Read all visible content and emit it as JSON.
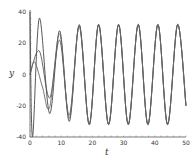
{
  "chart_data": {
    "type": "line",
    "title": "",
    "xlabel": "t",
    "ylabel": "y",
    "xlim": [
      0,
      50
    ],
    "ylim": [
      -40,
      40
    ],
    "xticks": [
      0,
      10,
      20,
      30,
      40,
      50
    ],
    "yticks": [
      -40,
      -20,
      0,
      20,
      40
    ],
    "grid": false,
    "legend": null,
    "series": [
      {
        "name": "curve-1",
        "description": "starts at 40, drops to about -40 near t=0.8, then converges to sinusoid",
        "x": [
          0,
          0.8,
          3,
          6.3,
          9.5,
          12.6,
          15.8,
          19,
          22,
          25.2,
          28.4,
          31.5,
          34.7,
          37.8,
          41,
          44.1,
          47.3,
          50
        ],
        "y": [
          40,
          -40,
          36,
          -25,
          28,
          -30,
          32,
          -32,
          32,
          -32,
          32,
          -32,
          32,
          -32,
          32,
          -32,
          32,
          -20
        ]
      },
      {
        "name": "curve-2",
        "description": "starts at 0, rises to about 15 near t=3, then to sinusoid",
        "x": [
          0,
          3,
          6.3,
          9.5,
          12.6,
          15.8,
          19,
          22,
          25.2,
          28.4,
          31.5,
          34.7,
          37.8,
          41,
          44.1,
          47.3,
          50
        ],
        "y": [
          0,
          15,
          -15,
          22,
          -26,
          31,
          -32,
          32,
          -32,
          32,
          -32,
          32,
          -32,
          32,
          -32,
          32,
          -20
        ]
      },
      {
        "name": "curve-3",
        "description": "starts at 0, rises to about 8, then sinusoid",
        "x": [
          0,
          1.5,
          4,
          6.3,
          9.5,
          12.6,
          15.8,
          19,
          22,
          25.2,
          28.4,
          31.5,
          34.7,
          37.8,
          41,
          44.1,
          47.3,
          50
        ],
        "y": [
          0,
          8,
          -8,
          -21,
          26,
          -28,
          31,
          -32,
          32,
          -32,
          32,
          -32,
          32,
          -32,
          32,
          -32,
          32,
          -20
        ]
      }
    ]
  },
  "axes": {
    "xlabel": "t",
    "ylabel": "y",
    "xtick_labels": [
      "0",
      "10",
      "20",
      "30",
      "40",
      "50"
    ],
    "ytick_labels": [
      "-40",
      "-20",
      "0",
      "20",
      "40"
    ]
  }
}
